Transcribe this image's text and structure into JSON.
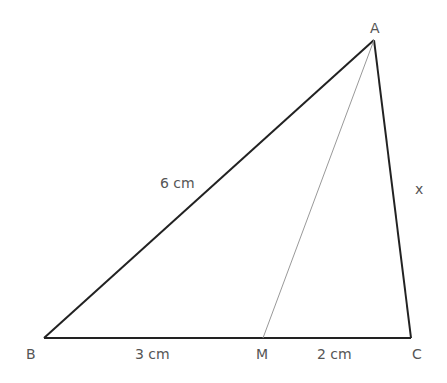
{
  "diagram": {
    "type": "triangle",
    "vertices": {
      "A": {
        "label": "A",
        "x": 374,
        "y": 40
      },
      "B": {
        "label": "B",
        "x": 44,
        "y": 338
      },
      "C": {
        "label": "C",
        "x": 411,
        "y": 338
      },
      "M": {
        "label": "M",
        "x": 263,
        "y": 338
      }
    },
    "edge_labels": {
      "AB": "6 cm",
      "BM": "3 cm",
      "MC": "2 cm",
      "AC": "x"
    },
    "colors": {
      "edge": "#222222",
      "median": "#999999",
      "label": "#555555"
    }
  }
}
